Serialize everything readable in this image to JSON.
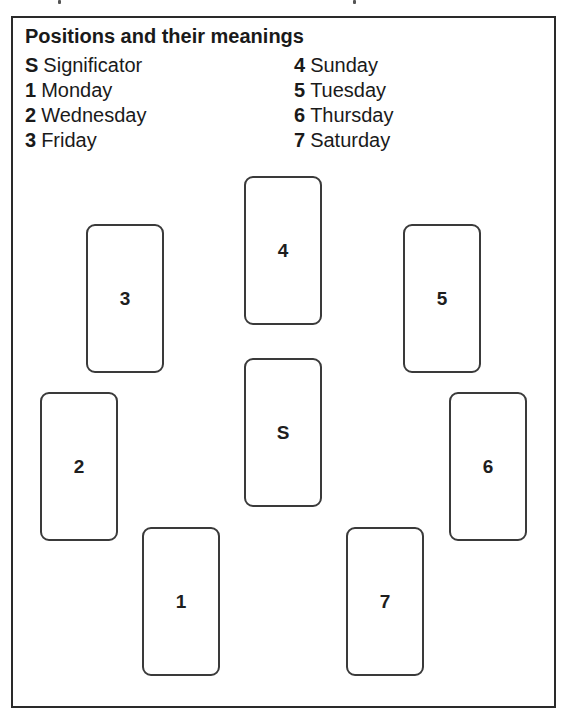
{
  "legend": {
    "title": "Positions and their meanings",
    "left_items": [
      {
        "key": "S",
        "meaning": "Significator"
      },
      {
        "key": "1",
        "meaning": "Monday"
      },
      {
        "key": "2",
        "meaning": "Wednesday"
      },
      {
        "key": "3",
        "meaning": "Friday"
      }
    ],
    "right_items": [
      {
        "key": "4",
        "meaning": "Sunday"
      },
      {
        "key": "5",
        "meaning": "Tuesday"
      },
      {
        "key": "6",
        "meaning": "Thursday"
      },
      {
        "key": "7",
        "meaning": "Saturday"
      }
    ]
  },
  "spread": {
    "cards": [
      {
        "label": "4",
        "meaning": "Sunday"
      },
      {
        "label": "3",
        "meaning": "Friday"
      },
      {
        "label": "5",
        "meaning": "Tuesday"
      },
      {
        "label": "S",
        "meaning": "Significator"
      },
      {
        "label": "2",
        "meaning": "Wednesday"
      },
      {
        "label": "6",
        "meaning": "Thursday"
      },
      {
        "label": "1",
        "meaning": "Monday"
      },
      {
        "label": "7",
        "meaning": "Saturday"
      }
    ]
  },
  "colors": {
    "line": "#2a2a2a",
    "text": "#1a1a1a",
    "background": "#ffffff"
  }
}
